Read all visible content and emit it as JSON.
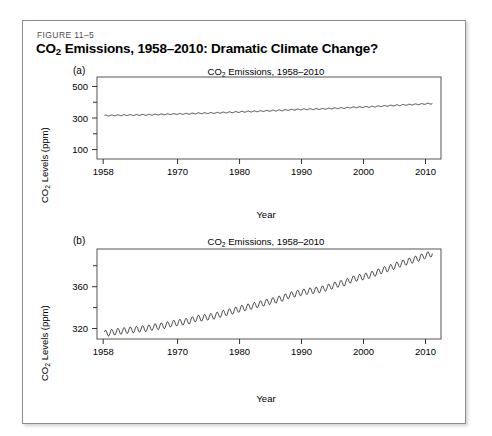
{
  "figure": {
    "number": "FIGURE 11–5",
    "title_prefix": "CO",
    "title_sub": "2",
    "title_rest": " Emissions, 1958–2010: Dramatic Climate Change?",
    "border_color": "#8d8d8d",
    "background": "#ffffff"
  },
  "panels": [
    {
      "letter": "(a)",
      "title_prefix": "CO",
      "title_sub": "2",
      "title_rest": " Emissions, 1958–2010",
      "ylabel_prefix": "CO",
      "ylabel_sub": "2",
      "ylabel_rest": " Levels (ppm)",
      "xlabel": "Year"
    },
    {
      "letter": "(b)",
      "title_prefix": "CO",
      "title_sub": "2",
      "title_rest": " Emissions, 1958–2010",
      "ylabel_prefix": "CO",
      "ylabel_sub": "2",
      "ylabel_rest": " Levels (ppm)",
      "xlabel": "Year"
    }
  ],
  "chart_data": [
    {
      "type": "line",
      "panel": "(a)",
      "title": "CO2 Emissions, 1958-2010",
      "xlabel": "Year",
      "ylabel": "CO2 Levels (ppm)",
      "xlim": [
        1957.0,
        2012.5
      ],
      "ylim": [
        40,
        560
      ],
      "xticks": [
        1958,
        1970,
        1980,
        1990,
        2000,
        2010
      ],
      "xtick_labels": [
        "1958",
        "1970",
        "1980",
        "1990",
        "2000",
        "2010"
      ],
      "yticks": [
        100,
        300,
        500
      ],
      "ytick_labels": [
        "100",
        "300",
        "500"
      ],
      "yticks_minor": [
        200,
        400
      ],
      "grid": false,
      "legend": null,
      "series": [
        {
          "name": "CO2 monthly mean (Mauna Loa)",
          "seasonal_amplitude_ppm": 3.0,
          "x": [
            1958.2,
            1959,
            1960,
            1961,
            1962,
            1963,
            1964,
            1965,
            1966,
            1967,
            1968,
            1969,
            1970,
            1971,
            1972,
            1973,
            1974,
            1975,
            1976,
            1977,
            1978,
            1979,
            1980,
            1981,
            1982,
            1983,
            1984,
            1985,
            1986,
            1987,
            1988,
            1989,
            1990,
            1991,
            1992,
            1993,
            1994,
            1995,
            1996,
            1997,
            1998,
            1999,
            2000,
            2001,
            2002,
            2003,
            2004,
            2005,
            2006,
            2007,
            2008,
            2009,
            2010,
            2011.1
          ],
          "values": [
            315.3,
            315.9,
            316.9,
            317.6,
            318.4,
            318.9,
            319.6,
            320.0,
            321.3,
            322.1,
            323.0,
            324.6,
            325.6,
            326.3,
            327.4,
            329.6,
            330.1,
            331.1,
            332.0,
            333.8,
            335.4,
            336.8,
            338.7,
            340.1,
            341.4,
            343.0,
            344.6,
            346.0,
            347.4,
            349.2,
            351.6,
            353.1,
            354.4,
            355.6,
            356.4,
            357.1,
            358.8,
            360.8,
            362.6,
            363.7,
            366.7,
            368.4,
            369.5,
            371.0,
            373.1,
            375.6,
            377.4,
            379.7,
            381.9,
            383.7,
            385.6,
            387.4,
            389.8,
            391.6
          ]
        }
      ]
    },
    {
      "type": "line",
      "panel": "(b)",
      "title": "CO2 Emissions, 1958-2010",
      "xlabel": "Year",
      "ylabel": "CO2 Levels (ppm)",
      "xlim": [
        1957.0,
        2012.5
      ],
      "ylim": [
        310.0,
        396.0
      ],
      "xticks": [
        1958,
        1970,
        1980,
        1990,
        2000,
        2010
      ],
      "xtick_labels": [
        "1958",
        "1970",
        "1980",
        "1990",
        "2000",
        "2010"
      ],
      "yticks": [
        320,
        360
      ],
      "ytick_labels": [
        "320",
        "360"
      ],
      "yticks_minor": [
        340,
        380
      ],
      "grid": false,
      "legend": null,
      "series": [
        {
          "name": "CO2 monthly mean (Mauna Loa)",
          "seasonal_amplitude_ppm": 3.0,
          "x": [
            1958.2,
            1959,
            1960,
            1961,
            1962,
            1963,
            1964,
            1965,
            1966,
            1967,
            1968,
            1969,
            1970,
            1971,
            1972,
            1973,
            1974,
            1975,
            1976,
            1977,
            1978,
            1979,
            1980,
            1981,
            1982,
            1983,
            1984,
            1985,
            1986,
            1987,
            1988,
            1989,
            1990,
            1991,
            1992,
            1993,
            1994,
            1995,
            1996,
            1997,
            1998,
            1999,
            2000,
            2001,
            2002,
            2003,
            2004,
            2005,
            2006,
            2007,
            2008,
            2009,
            2010,
            2011.1
          ],
          "values": [
            315.3,
            315.9,
            316.9,
            317.6,
            318.4,
            318.9,
            319.6,
            320.0,
            321.3,
            322.1,
            323.0,
            324.6,
            325.6,
            326.3,
            327.4,
            329.6,
            330.1,
            331.1,
            332.0,
            333.8,
            335.4,
            336.8,
            338.7,
            340.1,
            341.4,
            343.0,
            344.6,
            346.0,
            347.4,
            349.2,
            351.6,
            353.1,
            354.4,
            355.6,
            356.4,
            357.1,
            358.8,
            360.8,
            362.6,
            363.7,
            366.7,
            368.4,
            369.5,
            371.0,
            373.1,
            375.6,
            377.4,
            379.7,
            381.9,
            383.7,
            385.6,
            387.4,
            389.8,
            391.6
          ]
        }
      ]
    }
  ]
}
